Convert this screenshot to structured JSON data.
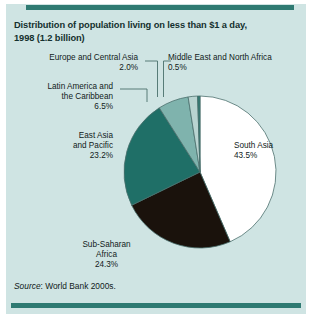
{
  "figure": {
    "title_line1": "Distribution of population living on less than $1 a day,",
    "title_line2": "1998 (1.2 billion)",
    "source_prefix": "Source",
    "source_text": ": World Bank 2000s."
  },
  "colors": {
    "panel_background": "#cfe4e3",
    "rule": "#2f7a72",
    "south_asia": "#ffffff",
    "sub_saharan_africa": "#1a120c",
    "east_asia_pacific": "#1f6f67",
    "latin_america": "#7fb3ad",
    "europe_central_asia": "#b9d4d1",
    "middle_east_north_africa": "#2f7a72",
    "outline": "#4a6f6c",
    "leader_line": "#4a6f6c",
    "text": "#111b1a"
  },
  "labels": {
    "europe_central_asia": "Europe and Central Asia\n2.0%",
    "middle_east_north_africa": "Middle East and North Africa\n0.5%",
    "latin_america": "Latin America and\nthe Caribbean\n6.5%",
    "east_asia_pacific": "East Asia\nand Pacific\n23.2%",
    "south_asia": "South Asia\n43.5%",
    "sub_saharan_africa": "Sub-Saharan\nAfrica\n24.3%"
  },
  "chart_data": {
    "type": "pie",
    "title": "Distribution of population living on less than $1 a day, 1998 (1.2 billion)",
    "unit": "percent",
    "total_population_billions": 1.2,
    "year": 1998,
    "start_angle_deg": 0,
    "direction": "clockwise",
    "categories": [
      "South Asia",
      "Sub-Saharan Africa",
      "East Asia and Pacific",
      "Latin America and the Caribbean",
      "Europe and Central Asia",
      "Middle East and North Africa"
    ],
    "values": [
      43.5,
      24.3,
      23.2,
      6.5,
      2.0,
      0.5
    ],
    "slice_colors": [
      "#ffffff",
      "#1a120c",
      "#1f6f67",
      "#7fb3ad",
      "#b9d4d1",
      "#2f7a72"
    ],
    "legend": "labels-with-leader-lines",
    "grid": false,
    "source": "Source: World Bank 2000s."
  }
}
